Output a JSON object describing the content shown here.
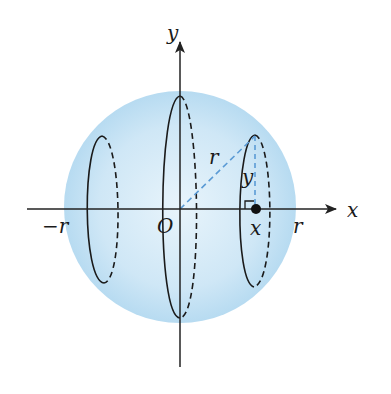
{
  "figure": {
    "type": "sphere-cross-section-diagram",
    "labels": {
      "y_axis": "y",
      "x_axis": "x",
      "origin": "O",
      "neg_r": "−r",
      "pos_r": "r",
      "radius": "r",
      "height": "y",
      "point_x": "x"
    },
    "colors": {
      "sphere_fill": "#bfe0f3",
      "sphere_fill_center": "#e6f3fb",
      "axis": "#222222",
      "dashed_blue": "#5b9bd5",
      "ellipse_stroke": "#1a1a1a"
    }
  }
}
